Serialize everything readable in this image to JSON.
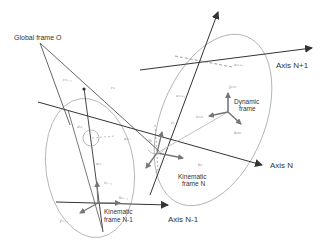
{
  "diagram": {
    "labels": {
      "global_frame": "Global frame O",
      "axis_n_plus_1": "Axis N+1",
      "axis_n": "Axis N",
      "axis_n_minus_1": "Axis N-1",
      "dynamic_frame_line1": "Dynamic",
      "dynamic_frame_line2": "frame",
      "kinematic_n_line1": "Kinematic",
      "kinematic_n_line2": "frame N",
      "kinematic_nm1_line1": "Kinematic",
      "kinematic_nm1_line2": "frame N-1"
    },
    "symbols": {
      "r_nm1": "rₙ₋₁",
      "r_n": "rₙ",
      "alpha_n_plus_1": "αₙ₊₁",
      "a_n_plus_1": "aₙ₊₁",
      "j_cm": "jᴄₘ",
      "i_cm": "iᴄₘ",
      "k_cm": "kᴄₘ",
      "i_n": "iₙ",
      "k_n": "kₙ",
      "j_n": "jₙ",
      "d_n": "dₙ",
      "alpha_n": "αₙ",
      "theta_n": "θₙ",
      "a_n": "aₙ",
      "i_nm1": "iₙ₋₁",
      "k_nm1": "kₙ₋₁",
      "j_nm1": "jₙ₋₁"
    }
  }
}
